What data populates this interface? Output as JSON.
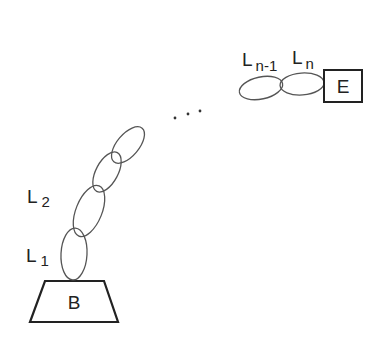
{
  "diagram": {
    "type": "serial-manipulator-kinematic-chain",
    "base": {
      "label": "B"
    },
    "end_effector": {
      "label": "E"
    },
    "links": [
      {
        "main": "L",
        "sub": "1"
      },
      {
        "main": "L",
        "sub": "2"
      },
      {
        "main": "L",
        "sub": "n-1"
      },
      {
        "main": "L",
        "sub": "n"
      }
    ],
    "ellipsis": "...",
    "colors": {
      "stroke": "#444444",
      "text": "#222222",
      "background": "#ffffff"
    }
  }
}
